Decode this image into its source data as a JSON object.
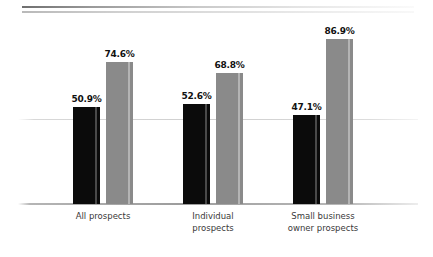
{
  "chart_data": {
    "type": "bar",
    "title": "",
    "subtitle": "",
    "xlabel": "",
    "ylabel": "",
    "ylim": [
      0,
      100
    ],
    "grid": true,
    "gridlines": [
      50
    ],
    "legend": "none",
    "value_label_format": "percent_one_decimal",
    "categories": [
      "All prospects",
      "Individual\nprospects",
      "Small business\nowner prospects"
    ],
    "series": [
      {
        "name": "series-1",
        "color": "#0b0b0b",
        "values": [
          50.9,
          52.6,
          47.1
        ],
        "labels": [
          "50.9%",
          "52.6%",
          "47.1%"
        ]
      },
      {
        "name": "series-2",
        "color": "#8a8a8a",
        "values": [
          74.6,
          68.8,
          86.9
        ],
        "labels": [
          "74.6%",
          "68.8%",
          "86.9%"
        ]
      }
    ]
  },
  "decor": {
    "rule_top": "gradient-rule",
    "rule_bottom": "gradient-rule"
  }
}
